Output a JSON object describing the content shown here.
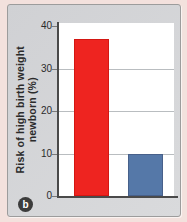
{
  "figure": {
    "badge_label": "b",
    "colors": {
      "outer_bg": "#f3e1dd",
      "panel_bg": "#d0d1d4",
      "panel_bg2": "#d9dadc",
      "panel_border": "#9c9c9c",
      "plot_bg": "#ffffff",
      "grid": "#b9bdc0",
      "axis": "#4a4a4a",
      "tick": "#7a7a7a",
      "text": "#2b2b2b",
      "badge_bg": "#3c3c3c",
      "badge_text": "#ffffff"
    }
  },
  "chart_data": {
    "type": "bar",
    "title": "",
    "xlabel": "",
    "ylabel": "Risk of high birth weight newborn (%)",
    "categories": [
      "",
      ""
    ],
    "values": [
      37,
      10
    ],
    "bar_colors": [
      "#ee2420",
      "#5578a8"
    ],
    "bar_borders": [
      "#d31713",
      "#47608a"
    ],
    "ylim": [
      0,
      40
    ],
    "yticks": [
      0,
      10,
      20,
      30,
      40
    ],
    "gridline_values": [
      10,
      20,
      30
    ],
    "grid": true,
    "legend": "none"
  }
}
